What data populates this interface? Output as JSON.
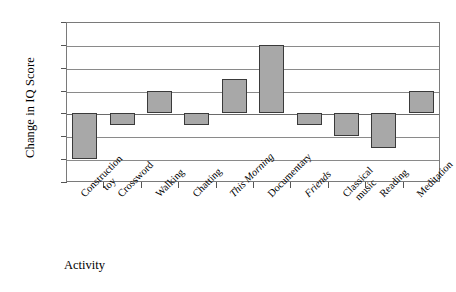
{
  "chart_data": {
    "type": "bar",
    "title": "",
    "xlabel": "Activity",
    "ylabel": "Change in IQ Score",
    "categories": [
      "Construction\ntoy",
      "Crossword",
      "Walking",
      "Chatting",
      "This Morning",
      "Documentary",
      "Friends",
      "Classical\nmusic",
      "Reading",
      "Meditation"
    ],
    "category_display": [
      {
        "line1": "Construction",
        "line2": "toy",
        "italic": false
      },
      {
        "line1": "Crossword",
        "line2": "",
        "italic": false
      },
      {
        "line1": "Walking",
        "line2": "",
        "italic": false
      },
      {
        "line1": "Chatting",
        "line2": "",
        "italic": false
      },
      {
        "line1": "This Morning",
        "line2": "",
        "italic": true
      },
      {
        "line1": "Documentary",
        "line2": "",
        "italic": false
      },
      {
        "line1": "Friends",
        "line2": "",
        "italic": true
      },
      {
        "line1": "Classical",
        "line2": "music",
        "italic": false
      },
      {
        "line1": "Reading",
        "line2": "",
        "italic": false
      },
      {
        "line1": "Meditation",
        "line2": "",
        "italic": false
      }
    ],
    "values": [
      -4,
      -1,
      2,
      -1,
      3,
      6,
      -1,
      -2,
      -3,
      2
    ],
    "ylim": [
      -6,
      8
    ],
    "yticks": [
      8,
      6,
      4,
      2,
      0,
      -2,
      -4,
      -6
    ],
    "ytick_labels": [
      "8",
      "6",
      "4",
      "2",
      "0",
      "-2",
      "-4",
      "-6"
    ],
    "grid": true,
    "legend": "none",
    "bar_color": "#a8a8a8",
    "bar_border_color": "#3a3a3a",
    "axis_color": "#7a7a7a"
  }
}
